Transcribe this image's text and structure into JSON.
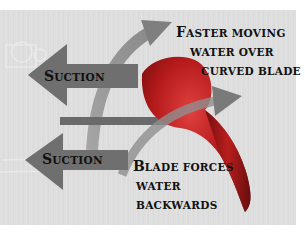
{
  "diagram": {
    "colors": {
      "background": "#dedede",
      "blade": "#b01818",
      "arrow": "#777777",
      "flow_arrow": "#8a8a8a",
      "text": "#111111"
    },
    "labels": {
      "suction_top": {
        "first": "S",
        "rest": "UCTION"
      },
      "suction_bottom": {
        "first": "S",
        "rest": "UCTION"
      },
      "faster_line1": {
        "first": "F",
        "rest": "ASTER MOVING"
      },
      "faster_line2": "WATER OVER",
      "faster_line3": "CURVED BLADE",
      "blade_line1": {
        "first": "B",
        "rest": "LADE FORCES"
      },
      "blade_line2": "WATER",
      "blade_line3": "BACKWARDS"
    },
    "elements": {
      "left_arrows": [
        "suction-arrow-top",
        "suction-arrow-bottom"
      ],
      "flow_arrows": [
        "upper-flow-arrow",
        "lower-flow-arrow"
      ],
      "shaft": "propeller-shaft",
      "blade": "propeller-blade"
    }
  }
}
